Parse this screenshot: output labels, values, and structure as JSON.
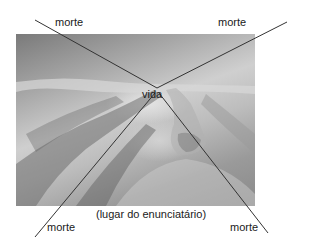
{
  "diagram": {
    "center_label": "vida",
    "corner_labels": {
      "top_left": "morte",
      "top_right": "morte",
      "bottom_left": "morte",
      "bottom_right": "morte"
    },
    "caption": "(lugar do enunciatário)",
    "line_color": "#333333",
    "background_image": "grayscale painting of hands reaching across a landscape"
  }
}
